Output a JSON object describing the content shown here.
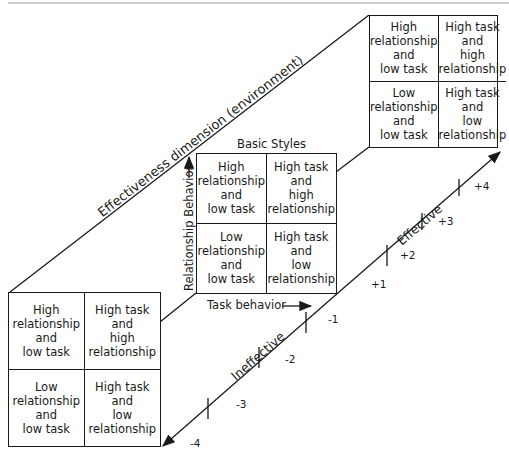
{
  "diagram": {
    "top_rule_color": "#888888",
    "line_color": "#1a1a1a",
    "dimension_label": "Effectiveness dimension (environment)",
    "basic_styles_title": "Basic Styles",
    "y_axis_label": "Relationship Behavior",
    "x_axis_label": "Task behavior",
    "effective_label": "Effective",
    "ineffective_label": "Ineffective",
    "ticks": [
      "-4",
      "-3",
      "-2",
      "-1",
      "+1",
      "+2",
      "+3",
      "+4"
    ],
    "grids": {
      "effective": {
        "cells": [
          "High\nrelationship\nand\nlow task",
          "High task\nand\nhigh\nrelationship",
          "Low\nrelationship\nand\nlow task",
          "High task\nand\nlow\nrelationship"
        ]
      },
      "basic": {
        "cells": [
          "High\nrelationship\nand\nlow task",
          "High task\nand\nhigh\nrelationship",
          "Low\nrelationship\nand\nlow task",
          "High task\nand\nlow\nrelationship"
        ]
      },
      "ineffective": {
        "cells": [
          "High\nrelationship\nand\nlow task",
          "High task\nand\nhigh\nrelationship",
          "Low\nrelationship\nand\nlow task",
          "High task\nand\nlow\nrelationship"
        ]
      }
    }
  }
}
